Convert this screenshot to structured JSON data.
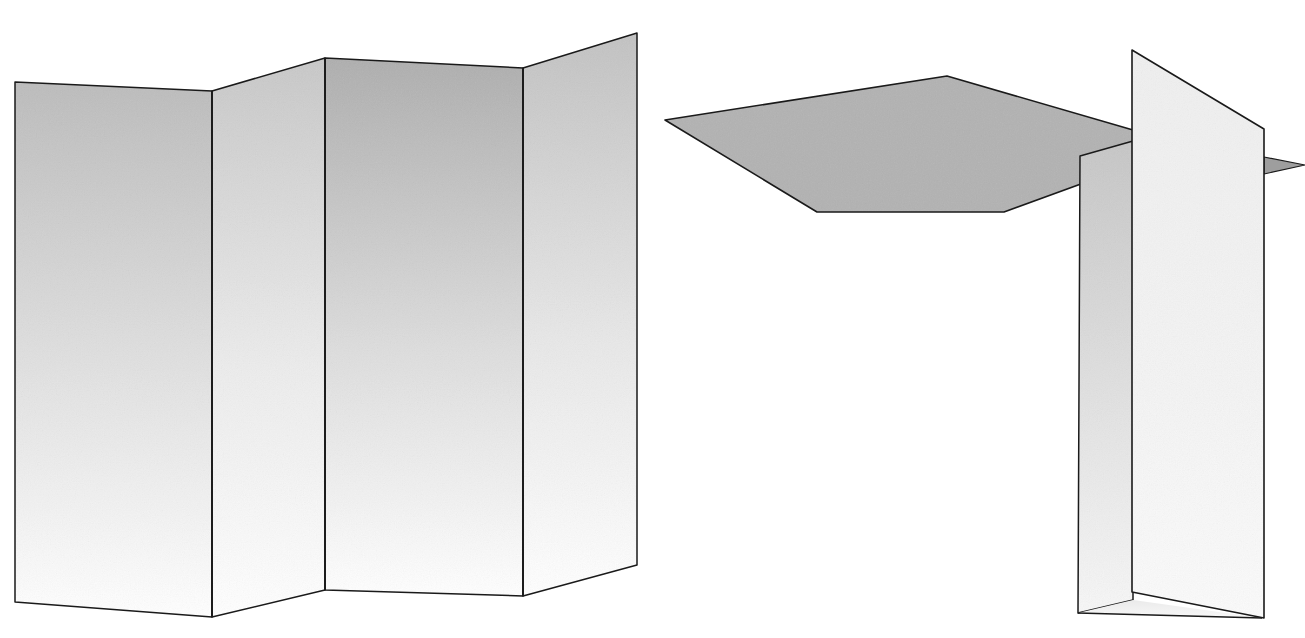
{
  "page": {
    "background_color": "#ffffff",
    "width": 1305,
    "height": 638,
    "stroke_color": "#1a1a1a",
    "stroke_width": 1.6
  },
  "figures": [
    {
      "id": "left-figure",
      "name": "accordion-folded-sheet",
      "description": "Zigzag accordion-folded sheet seen in perspective, four rectangular facets alternating fold direction",
      "facet_count": 4,
      "facets": [
        {
          "name": "facet-1",
          "points": "15,82 212,91 212,617 15,602",
          "fill_top": "#bcbcbc",
          "fill_bottom": "#ffffff",
          "shading": "vertical-gradient"
        },
        {
          "name": "facet-2",
          "points": "212,91 325,58 325,590 212,617",
          "fill_top": "#c8c8c8",
          "fill_bottom": "#ffffff",
          "shading": "vertical-gradient"
        },
        {
          "name": "facet-3",
          "points": "325,58 523,68 523,596 325,590",
          "fill_top": "#aeaeae",
          "fill_bottom": "#ffffff",
          "shading": "vertical-gradient"
        },
        {
          "name": "facet-4",
          "points": "523,68 637,33 637,565 523,596",
          "fill_top": "#c2c2c2",
          "fill_bottom": "#ffffff",
          "shading": "vertical-gradient"
        }
      ],
      "fold_edges": [
        {
          "name": "fold-edge-1",
          "x1": 212,
          "y1": 91,
          "x2": 212,
          "y2": 617
        },
        {
          "name": "fold-edge-2",
          "x1": 325,
          "y1": 58,
          "x2": 325,
          "y2": 590
        },
        {
          "name": "fold-edge-3",
          "x1": 523,
          "y1": 68,
          "x2": 523,
          "y2": 596
        }
      ]
    },
    {
      "id": "right-figure",
      "name": "t-junction-plate-assembly",
      "description": "Horizontal gray plate meeting two upright panels forming a T/L junction in perspective",
      "parts": [
        {
          "name": "horizontal-plate",
          "points": "665,120 947,76 1133,130 1133,165 1004,212 817,212",
          "fill": "#b2b2b2",
          "shading": "flat"
        },
        {
          "name": "back-upright-panel",
          "points": "1080,156 1133,141 1133,600 1078,613",
          "fill_top": "#cacaca",
          "fill_bottom": "#f4f4f4",
          "shading": "vertical-gradient"
        },
        {
          "name": "back-upright-panel-lower",
          "points": "1078,613 1133,600 1262,618 1078,613",
          "fill_top": "#e8e8e8",
          "fill_bottom": "#f6f6f6",
          "shading": "vertical-gradient"
        },
        {
          "name": "front-upright-panel",
          "points": "1132,50 1264,129 1264,618 1132,592",
          "fill_top": "#f2f2f2",
          "fill_bottom": "#fbfbfb",
          "shading": "vertical-gradient"
        },
        {
          "name": "right-sliver-flange",
          "points": "1264,157 1305,165 1264,174",
          "fill": "#9e9e9e",
          "shading": "flat"
        }
      ]
    }
  ],
  "annotations": {
    "labels": [],
    "note": ""
  },
  "palette": {
    "background": "#ffffff",
    "outline": "#1a1a1a",
    "plate_gray": "#b2b2b2",
    "panel_light": "#f2f2f2",
    "panel_mid": "#c8c8c8",
    "panel_dark": "#aeaeae"
  }
}
